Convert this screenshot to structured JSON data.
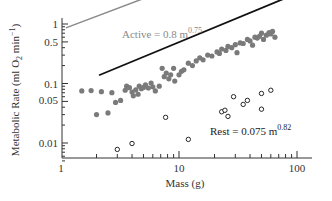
{
  "chart_data": {
    "type": "scatter",
    "title": "",
    "xlabel": "Mass (g)",
    "ylabel": "Metabolic Rate (ml O2 min^-1)",
    "xscale": "log",
    "yscale": "log",
    "xlim": [
      1,
      150
    ],
    "ylim": [
      0.005,
      1.5
    ],
    "x_ticks": [
      "1",
      "10",
      "100"
    ],
    "y_ticks": [
      "1",
      "0.5",
      "0.1",
      "0.05",
      "0.01"
    ],
    "grid": false,
    "series": [
      {
        "name": "Active",
        "marker": "filled-circle",
        "color": "#7a7a7a",
        "fit_equation": "Active = 0.8 m^0.75",
        "fit": {
          "a": 0.8,
          "b": 0.75,
          "x_range": [
            1.1,
            110
          ]
        },
        "points": [
          [
            1.5,
            0.075
          ],
          [
            1.8,
            0.076
          ],
          [
            2.2,
            0.073
          ],
          [
            2.0,
            0.03
          ],
          [
            2.5,
            0.032
          ],
          [
            2.7,
            0.07
          ],
          [
            2.9,
            0.048
          ],
          [
            3.2,
            0.052
          ],
          [
            3.5,
            0.077
          ],
          [
            3.6,
            0.09
          ],
          [
            3.8,
            0.085
          ],
          [
            4.0,
            0.072
          ],
          [
            4.1,
            0.062
          ],
          [
            4.3,
            0.078
          ],
          [
            4.5,
            0.066
          ],
          [
            4.6,
            0.09
          ],
          [
            4.8,
            0.082
          ],
          [
            5.0,
            0.086
          ],
          [
            5.2,
            0.095
          ],
          [
            5.5,
            0.084
          ],
          [
            5.8,
            0.102
          ],
          [
            6.0,
            0.088
          ],
          [
            6.3,
            0.075
          ],
          [
            6.8,
            0.09
          ],
          [
            7.2,
            0.18
          ],
          [
            7.5,
            0.13
          ],
          [
            7.8,
            0.15
          ],
          [
            8.2,
            0.12
          ],
          [
            8.5,
            0.14
          ],
          [
            9.0,
            0.18
          ],
          [
            9.2,
            0.11
          ],
          [
            10.0,
            0.14
          ],
          [
            10.5,
            0.16
          ],
          [
            11.0,
            0.17
          ],
          [
            12.0,
            0.22
          ],
          [
            13.0,
            0.2
          ],
          [
            14.0,
            0.24
          ],
          [
            15.0,
            0.27
          ],
          [
            16.0,
            0.25
          ],
          [
            17.5,
            0.3
          ],
          [
            19.0,
            0.29
          ],
          [
            21.0,
            0.34
          ],
          [
            22.0,
            0.32
          ],
          [
            23.0,
            0.38
          ],
          [
            25.0,
            0.36
          ],
          [
            26.0,
            0.42
          ],
          [
            28.0,
            0.4
          ],
          [
            30.0,
            0.45
          ],
          [
            31.0,
            0.33
          ],
          [
            33.0,
            0.48
          ],
          [
            35.0,
            0.47
          ],
          [
            38.0,
            0.55
          ],
          [
            40.0,
            0.52
          ],
          [
            42.0,
            0.44
          ],
          [
            44.0,
            0.6
          ],
          [
            46.0,
            0.58
          ],
          [
            48.0,
            0.62
          ],
          [
            50.0,
            0.7
          ],
          [
            52.0,
            0.55
          ],
          [
            55.0,
            0.65
          ],
          [
            58.0,
            0.72
          ],
          [
            60.0,
            0.68
          ],
          [
            62.0,
            0.75
          ],
          [
            65.0,
            0.6
          ]
        ]
      },
      {
        "name": "Rest",
        "marker": "open-circle",
        "color": "#111111",
        "fit_equation": "Rest = 0.075 m^0.82",
        "fit": {
          "a": 0.075,
          "b": 0.82,
          "x_range": [
            2.1,
            110
          ]
        },
        "points": [
          [
            3.0,
            0.0078
          ],
          [
            4.0,
            0.0098
          ],
          [
            7.7,
            0.027
          ],
          [
            12.0,
            0.0115
          ],
          [
            23.0,
            0.0335
          ],
          [
            24.5,
            0.0355
          ],
          [
            26.0,
            0.028
          ],
          [
            29.0,
            0.06
          ],
          [
            35.0,
            0.0445
          ],
          [
            38.0,
            0.052
          ],
          [
            50.0,
            0.037
          ],
          [
            50.0,
            0.068
          ],
          [
            60.0,
            0.077
          ]
        ]
      }
    ]
  },
  "labels": {
    "active_eq": "Active = 0.8 m",
    "active_exp": "0.75",
    "rest_eq": "Rest = 0.075 m",
    "rest_exp": "0.82",
    "xlabel": "Mass (g)",
    "ylabel_main": "Metabolic Rate (ml O",
    "ylabel_sub": "2",
    "ylabel_tail": " min",
    "ylabel_sup": "−1",
    "ylabel_close": ")",
    "xtick_1": "1",
    "xtick_10": "10",
    "xtick_100": "100",
    "ytick_1": "1",
    "ytick_05": "0.5",
    "ytick_01": "0.1",
    "ytick_005": "0.05",
    "ytick_001": "0.01"
  }
}
